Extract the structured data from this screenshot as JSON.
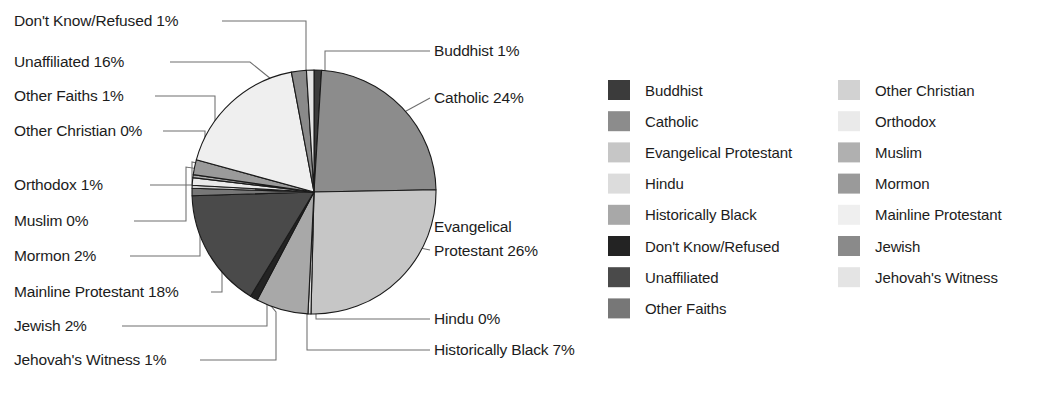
{
  "chart_data": {
    "type": "pie",
    "title": "",
    "subtitle": "",
    "xlabel": "",
    "ylabel": "",
    "grid": false,
    "legend_position": "right",
    "legend_columns": 2,
    "start_angle_deg": 0,
    "direction": "clockwise",
    "units": "%",
    "categories": [
      "Buddhist",
      "Catholic",
      "Evangelical Protestant",
      "Hindu",
      "Historically Black",
      "Don't Know/Refused",
      "Unaffiliated",
      "Other Faiths",
      "Other Christian",
      "Orthodox",
      "Muslim",
      "Mormon",
      "Mainline Protestant",
      "Jewish",
      "Jehovah's Witness"
    ],
    "values": [
      1,
      24,
      26,
      0.4,
      7,
      1,
      16,
      1,
      0.4,
      1,
      0.4,
      2,
      18,
      2,
      1
    ],
    "value_labels": [
      "1%",
      "24%",
      "26%",
      "0%",
      "7%",
      "1%",
      "16%",
      "1%",
      "0%",
      "1%",
      "0%",
      "2%",
      "18%",
      "2%",
      "1%"
    ],
    "colors": [
      "#3b3b3b",
      "#8c8c8c",
      "#c6c6c6",
      "#dcdcdc",
      "#a8a8a8",
      "#232323",
      "#4a4a4a",
      "#777777",
      "#d2d2d2",
      "#eaeaea",
      "#b0b0b0",
      "#9a9a9a",
      "#efefef",
      "#8a8a8a",
      "#e4e4e4"
    ]
  },
  "callouts": {
    "left": [
      {
        "text": "Don't Know/Refused 1%",
        "name": "callout-dont-know-refused"
      },
      {
        "text": "Unaffiliated 16%",
        "name": "callout-unaffiliated"
      },
      {
        "text": "Other Faiths 1%",
        "name": "callout-other-faiths"
      },
      {
        "text": "Other Christian 0%",
        "name": "callout-other-christian"
      },
      {
        "text": "Orthodox 1%",
        "name": "callout-orthodox"
      },
      {
        "text": "Muslim 0%",
        "name": "callout-muslim"
      },
      {
        "text": "Mormon 2%",
        "name": "callout-mormon"
      },
      {
        "text": "Mainline Protestant 18%",
        "name": "callout-mainline-protestant"
      },
      {
        "text": "Jewish 2%",
        "name": "callout-jewish"
      },
      {
        "text": "Jehovah's Witness 1%",
        "name": "callout-jehovahs-witness"
      }
    ],
    "right": [
      {
        "text": "Buddhist 1%",
        "name": "callout-buddhist"
      },
      {
        "text": "Catholic 24%",
        "name": "callout-catholic"
      },
      {
        "text": "Evangelical",
        "name": "callout-evangelical-protestant-line1"
      },
      {
        "text": "Protestant 26%",
        "name": "callout-evangelical-protestant-line2"
      },
      {
        "text": "Hindu 0%",
        "name": "callout-hindu"
      },
      {
        "text": "Historically Black 7%",
        "name": "callout-historically-black"
      }
    ]
  },
  "legend": {
    "column1": [
      {
        "label": "Buddhist",
        "color": "#3b3b3b"
      },
      {
        "label": "Catholic",
        "color": "#8c8c8c"
      },
      {
        "label": "Evangelical Protestant",
        "color": "#c6c6c6"
      },
      {
        "label": "Hindu",
        "color": "#dcdcdc"
      },
      {
        "label": "Historically Black",
        "color": "#a8a8a8"
      },
      {
        "label": "Don't Know/Refused",
        "color": "#232323"
      },
      {
        "label": "Unaffiliated",
        "color": "#4a4a4a"
      },
      {
        "label": "Other Faiths",
        "color": "#777777"
      }
    ],
    "column2": [
      {
        "label": "Other Christian",
        "color": "#d2d2d2"
      },
      {
        "label": "Orthodox",
        "color": "#eaeaea"
      },
      {
        "label": "Muslim",
        "color": "#b0b0b0"
      },
      {
        "label": "Mormon",
        "color": "#9a9a9a"
      },
      {
        "label": "Mainline Protestant",
        "color": "#efefef"
      },
      {
        "label": "Jewish",
        "color": "#8a8a8a"
      },
      {
        "label": "Jehovah's Witness",
        "color": "#e4e4e4"
      }
    ]
  }
}
